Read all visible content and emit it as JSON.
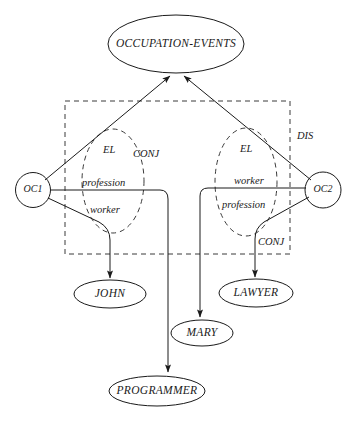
{
  "diagram": {
    "colors": {
      "stroke": "#1a1a1a",
      "dashed_stroke": "#3a3a3a",
      "background": "#ffffff"
    },
    "nodes": {
      "occupation_events": "OCCUPATION-EVENTS",
      "oc1": "OC1",
      "oc2": "OC2",
      "john": "JOHN",
      "lawyer": "LAWYER",
      "mary": "MARY",
      "programmer": "PROGRAMMER"
    },
    "region_labels": {
      "dis": "DIS",
      "el_left": "EL",
      "el_right": "EL",
      "conj_left": "CONJ",
      "conj_right": "CONJ"
    },
    "edge_labels": {
      "left_profession": "profession",
      "left_worker": "worker",
      "right_worker": "worker",
      "right_profession": "profession"
    }
  }
}
